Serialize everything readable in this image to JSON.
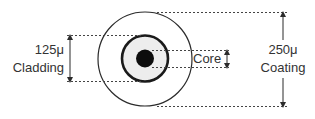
{
  "diagram": {
    "colors": {
      "line": "#2b2b2b",
      "text": "#333333",
      "cladding_fill": "#ededed",
      "core_fill": "#0d0d0d",
      "background": "#ffffff"
    },
    "layers": [
      {
        "name": "Coating",
        "size": "250μ"
      },
      {
        "name": "Cladding",
        "size": "125μ"
      },
      {
        "name": "Core",
        "size": ""
      }
    ],
    "labels": {
      "cladding_size": "125μ",
      "cladding_name": "Cladding",
      "core_name": "Core",
      "coating_size": "250μ",
      "coating_name": "Coating"
    }
  }
}
